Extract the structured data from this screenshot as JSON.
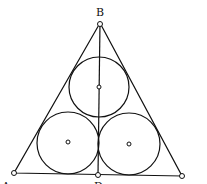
{
  "diagram": {
    "type": "geometry",
    "labels": {
      "B": "B",
      "A": "A",
      "D": "D"
    },
    "points": {
      "B": [
        100,
        23
      ],
      "A": [
        14,
        173
      ],
      "C": [
        182,
        176
      ],
      "D": [
        98,
        175
      ]
    },
    "circles": [
      {
        "name": "top-circle",
        "cx": 99,
        "cy": 87,
        "r": 30
      },
      {
        "name": "bottom-left-circle",
        "cx": 68,
        "cy": 143,
        "r": 31
      },
      {
        "name": "bottom-right-circle",
        "cx": 129,
        "cy": 144,
        "r": 31
      }
    ],
    "stroke_color": "#111111"
  }
}
